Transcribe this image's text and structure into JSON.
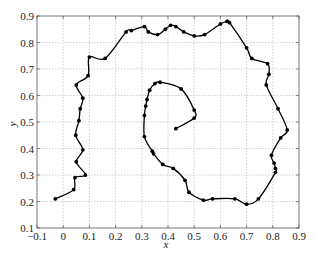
{
  "chart_data": {
    "type": "line",
    "title": "",
    "xlabel": "x",
    "ylabel": "y",
    "xlim": [
      -0.1,
      0.9
    ],
    "ylim": [
      0.1,
      0.9
    ],
    "xticks": [
      "−0.1",
      "0",
      "0.1",
      "0.2",
      "0.3",
      "0.4",
      "0.5",
      "0.6",
      "0.7",
      "0.8",
      "0.9"
    ],
    "yticks": [
      "0.1",
      "0.2",
      "0.3",
      "0.4",
      "0.5",
      "0.6",
      "0.7",
      "0.8",
      "0.9"
    ],
    "grid": true,
    "legend": null,
    "series": [
      {
        "name": "trajectory",
        "marker": "dot",
        "color": "#000000",
        "points": [
          [
            -0.03,
            0.21
          ],
          [
            0.04,
            0.245
          ],
          [
            0.045,
            0.29
          ],
          [
            0.085,
            0.3
          ],
          [
            0.05,
            0.35
          ],
          [
            0.075,
            0.395
          ],
          [
            0.048,
            0.45
          ],
          [
            0.06,
            0.505
          ],
          [
            0.065,
            0.55
          ],
          [
            0.075,
            0.59
          ],
          [
            0.05,
            0.64
          ],
          [
            0.095,
            0.675
          ],
          [
            0.1,
            0.745
          ],
          [
            0.16,
            0.74
          ],
          [
            0.24,
            0.84
          ],
          [
            0.26,
            0.845
          ],
          [
            0.31,
            0.86
          ],
          [
            0.325,
            0.84
          ],
          [
            0.36,
            0.83
          ],
          [
            0.39,
            0.85
          ],
          [
            0.41,
            0.865
          ],
          [
            0.43,
            0.86
          ],
          [
            0.46,
            0.84
          ],
          [
            0.5,
            0.825
          ],
          [
            0.54,
            0.83
          ],
          [
            0.6,
            0.87
          ],
          [
            0.625,
            0.88
          ],
          [
            0.635,
            0.875
          ],
          [
            0.7,
            0.78
          ],
          [
            0.72,
            0.74
          ],
          [
            0.78,
            0.72
          ],
          [
            0.785,
            0.68
          ],
          [
            0.775,
            0.64
          ],
          [
            0.82,
            0.55
          ],
          [
            0.855,
            0.47
          ],
          [
            0.83,
            0.44
          ],
          [
            0.795,
            0.375
          ],
          [
            0.805,
            0.345
          ],
          [
            0.81,
            0.325
          ],
          [
            0.81,
            0.31
          ],
          [
            0.745,
            0.21
          ],
          [
            0.7,
            0.19
          ],
          [
            0.655,
            0.21
          ],
          [
            0.57,
            0.21
          ],
          [
            0.535,
            0.205
          ],
          [
            0.48,
            0.235
          ],
          [
            0.465,
            0.28
          ],
          [
            0.42,
            0.325
          ],
          [
            0.38,
            0.34
          ],
          [
            0.345,
            0.38
          ],
          [
            0.34,
            0.39
          ],
          [
            0.31,
            0.445
          ],
          [
            0.31,
            0.525
          ],
          [
            0.315,
            0.56
          ],
          [
            0.32,
            0.585
          ],
          [
            0.33,
            0.62
          ],
          [
            0.35,
            0.645
          ],
          [
            0.37,
            0.65
          ],
          [
            0.45,
            0.625
          ],
          [
            0.5,
            0.545
          ],
          [
            0.5,
            0.515
          ],
          [
            0.43,
            0.475
          ]
        ]
      }
    ]
  }
}
